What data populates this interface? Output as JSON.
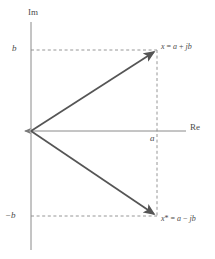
{
  "figure": {
    "width": 215,
    "height": 259,
    "background": "#ffffff",
    "ink_color": "#6b6b6b",
    "text_color": "#4b4b4b"
  },
  "axes": {
    "imaginary": {
      "label": "Im",
      "x": 31,
      "y_top": 22,
      "y_bottom": 250
    },
    "real": {
      "label": "Re",
      "y": 131,
      "x_left": 31,
      "x_right": 186,
      "arrow": "left"
    },
    "origin": {
      "x": 31,
      "y": 131
    }
  },
  "ticks": [
    {
      "name": "b",
      "label": "b",
      "axis": "imaginary",
      "x": 31,
      "y": 50
    },
    {
      "name": "-b",
      "label": "−b",
      "axis": "imaginary",
      "x": 31,
      "y": 216
    },
    {
      "name": "a",
      "label": "a",
      "axis": "real",
      "x": 157,
      "y": 131
    }
  ],
  "vectors": [
    {
      "name": "x",
      "label_parts": {
        "var": "x",
        "eq": " = ",
        "re": "a",
        "op": " + ",
        "im": "j",
        "imvar": "b"
      },
      "label_text": "x = a + jb",
      "from": {
        "x": 31,
        "y": 131
      },
      "to": {
        "x": 157,
        "y": 50
      }
    },
    {
      "name": "x-conjugate",
      "label_parts": {
        "var": "x",
        "star": "*",
        "eq": " = ",
        "re": "a",
        "op": " − ",
        "im": "j",
        "imvar": "b"
      },
      "label_text": "x* = a − jb",
      "from": {
        "x": 31,
        "y": 131
      },
      "to": {
        "x": 157,
        "y": 216
      }
    }
  ],
  "guides": [
    {
      "name": "guide-b-horizontal",
      "orientation": "horizontal",
      "x1": 31,
      "y1": 50,
      "x2": 157,
      "y2": 50
    },
    {
      "name": "guide-negb-horizontal",
      "orientation": "horizontal",
      "x1": 31,
      "y1": 216,
      "x2": 157,
      "y2": 216
    },
    {
      "name": "guide-a-vertical",
      "orientation": "vertical",
      "x1": 157,
      "y1": 50,
      "x2": 157,
      "y2": 216
    }
  ]
}
